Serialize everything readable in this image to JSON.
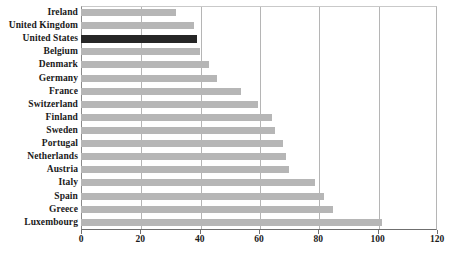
{
  "chart_data": {
    "type": "bar",
    "orientation": "horizontal",
    "title": "",
    "xlabel": "",
    "ylabel": "",
    "xlim": [
      0,
      120
    ],
    "xticks": [
      0,
      20,
      40,
      60,
      80,
      100,
      120
    ],
    "xtick_labels": [
      "0",
      "20",
      "40",
      "60",
      "80",
      "100",
      "120"
    ],
    "grid": "vertical",
    "legend": "none",
    "highlight_category": "United States",
    "colors": {
      "bar": "#b6b6b6",
      "bar_highlight": "#262626",
      "gridline": "#b5b5b5",
      "axis": "#6f6f6f",
      "text": "#1a1a1a",
      "background": "#ffffff"
    },
    "categories": [
      "Ireland",
      "United Kingdom",
      "United States",
      "Belgium",
      "Denmark",
      "Germany",
      "France",
      "Switzerland",
      "Finland",
      "Sweden",
      "Portugal",
      "Netherlands",
      "Austria",
      "Italy",
      "Spain",
      "Greece",
      "Luxembourg"
    ],
    "values": [
      32,
      38,
      39,
      40,
      43,
      46,
      54,
      59.5,
      64.5,
      65.5,
      68,
      69,
      70,
      79,
      82,
      85,
      101.5
    ]
  }
}
